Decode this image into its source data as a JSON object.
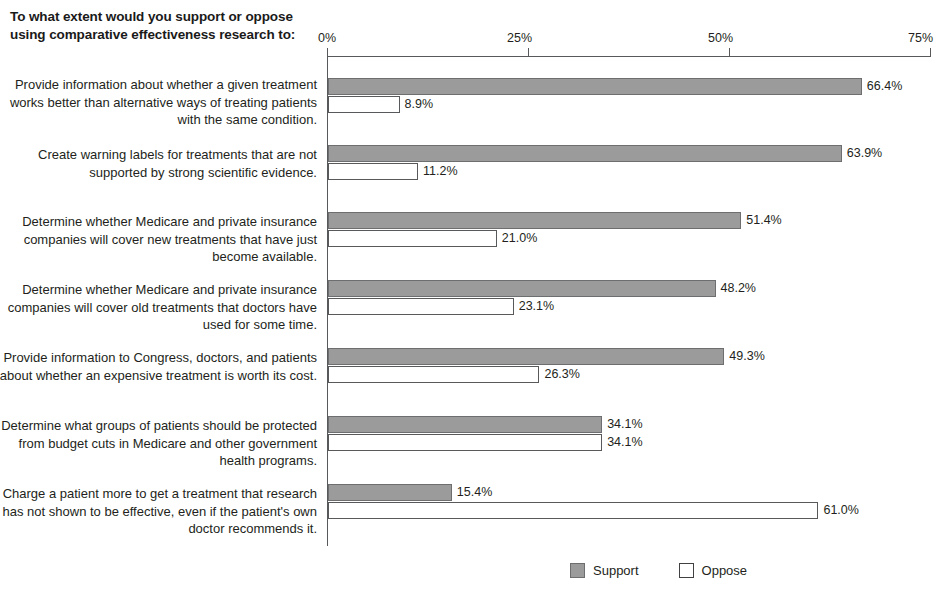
{
  "title": "To what extent would you support or oppose using comparative effectiveness research to:",
  "colors": {
    "support_fill": "#9b9b9b",
    "support_border": "#6d6e70",
    "oppose_fill": "#ffffff",
    "oppose_border": "#58595b",
    "axis": "#58595b",
    "text": "#231f20"
  },
  "legend": {
    "position": "bottom-center",
    "items": [
      {
        "label": "Support",
        "style": "support"
      },
      {
        "label": "Oppose",
        "style": "oppose"
      }
    ]
  },
  "axis": {
    "ticks": [
      "0%",
      "25%",
      "50%",
      "75%"
    ],
    "tick_values": [
      0,
      25,
      50,
      75
    ]
  },
  "chart_data": {
    "type": "bar",
    "orientation": "horizontal",
    "title": "To what extent would you support or oppose using comparative effectiveness research to:",
    "xlabel": "",
    "ylabel": "",
    "xlim": [
      0,
      75
    ],
    "xticks": [
      0,
      25,
      50,
      75
    ],
    "xtick_labels": [
      "0%",
      "25%",
      "50%",
      "75%"
    ],
    "grid": false,
    "legend": [
      "Support",
      "Oppose"
    ],
    "categories": [
      "Provide information about whether a given treatment works better than alternative ways of treating patients with the same condition.",
      "Create warning labels for treatments that are not supported by strong scientific evidence.",
      "Determine whether Medicare and private insurance companies will cover new treatments that have just become available.",
      "Determine whether Medicare and private insurance companies will cover old treatments that doctors have used for some time.",
      "Provide information to Congress, doctors, and patients about whether an expensive treatment is worth its cost.",
      "Determine what groups of patients should be protected from budget cuts in Medicare and other government health programs.",
      "Charge a patient more to get a treatment that research has not shown to be effective, even if the patient's own doctor recommends it."
    ],
    "series": [
      {
        "name": "Support",
        "values": [
          66.4,
          63.9,
          51.4,
          48.2,
          49.3,
          34.1,
          15.4
        ]
      },
      {
        "name": "Oppose",
        "values": [
          8.9,
          11.2,
          21.0,
          23.1,
          26.3,
          34.1,
          61.0
        ]
      }
    ],
    "value_labels": {
      "Support": [
        "66.4%",
        "63.9%",
        "51.4%",
        "48.2%",
        "49.3%",
        "34.1%",
        "15.4%"
      ],
      "Oppose": [
        "8.9%",
        "11.2%",
        "21.0%",
        "23.1%",
        "26.3%",
        "34.1%",
        "61.0%"
      ]
    }
  },
  "groups": [
    {
      "label": "Provide information about whether a given treatment works better than alternative ways of treating patients with the same condition.",
      "label_top": 76,
      "group_top": 60,
      "support": {
        "value": 66.4,
        "text": "66.4%",
        "top": 78
      },
      "oppose": {
        "value": 8.9,
        "text": "8.9%",
        "top": 96
      }
    },
    {
      "label": "Create warning labels for treatments that are not supported by strong scientific evidence.",
      "label_top": 146,
      "group_top": 130,
      "support": {
        "value": 63.9,
        "text": "63.9%",
        "top": 145
      },
      "oppose": {
        "value": 11.2,
        "text": "11.2%",
        "top": 163
      }
    },
    {
      "label": "Determine whether Medicare and private insurance companies will cover new treatments that have just become available.",
      "label_top": 213,
      "group_top": 197,
      "support": {
        "value": 51.4,
        "text": "51.4%",
        "top": 212
      },
      "oppose": {
        "value": 21.0,
        "text": "21.0%",
        "top": 230
      }
    },
    {
      "label": "Determine whether Medicare and private insurance companies will cover old treatments that doctors have used for some time.",
      "label_top": 281,
      "group_top": 265,
      "support": {
        "value": 48.2,
        "text": "48.2%",
        "top": 280
      },
      "oppose": {
        "value": 23.1,
        "text": "23.1%",
        "top": 298
      }
    },
    {
      "label": "Provide information to Congress, doctors, and patients about whether an expensive treatment is worth its cost.",
      "label_top": 349,
      "group_top": 333,
      "support": {
        "value": 49.3,
        "text": "49.3%",
        "top": 348
      },
      "oppose": {
        "value": 26.3,
        "text": "26.3%",
        "top": 366
      }
    },
    {
      "label": "Determine what groups of patients should be protected from budget cuts in Medicare and other government health programs.",
      "label_top": 417,
      "group_top": 401,
      "support": {
        "value": 34.1,
        "text": "34.1%",
        "top": 416
      },
      "oppose": {
        "value": 34.1,
        "text": "34.1%",
        "top": 434
      }
    },
    {
      "label": "Charge a patient more to get a treatment that research has not shown to be effective, even if the patient's own doctor recommends it.",
      "label_top": 485,
      "group_top": 469,
      "support": {
        "value": 15.4,
        "text": "15.4%",
        "top": 484
      },
      "oppose": {
        "value": 61.0,
        "text": "61.0%",
        "top": 502
      }
    }
  ]
}
